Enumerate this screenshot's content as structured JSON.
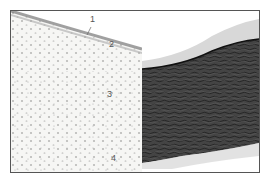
{
  "figure": {
    "panels": [
      {
        "id": "left",
        "description": "histological section, light stain, layered cells",
        "labels": [
          {
            "text": "1",
            "x": 89,
            "y": 19
          },
          {
            "text": "2",
            "x": 108,
            "y": 42
          },
          {
            "text": "3",
            "x": 106,
            "y": 88
          },
          {
            "text": "4",
            "x": 110,
            "y": 152
          }
        ]
      },
      {
        "id": "right",
        "description": "histological section, dense dark fibrous stain"
      }
    ],
    "colors": {
      "frame": "#555555",
      "left_tissue": "#f4f4f2",
      "left_cells": "#8a8a8a",
      "right_tissue": "#3d3d3d",
      "right_fibers": "#1e1e1e"
    }
  }
}
